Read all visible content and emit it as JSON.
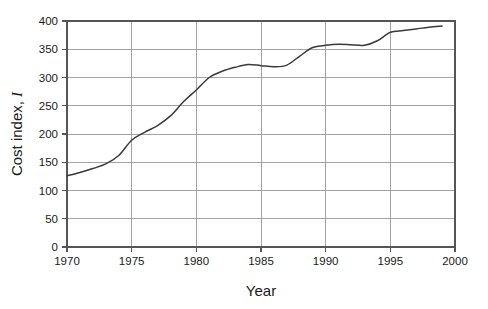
{
  "chart_data": {
    "type": "line",
    "title": "",
    "xlabel": "Year",
    "ylabel": "Cost index, I",
    "ylabel_text": "Cost index,",
    "ylabel_symbol": "I",
    "xlim": [
      1970,
      2000
    ],
    "ylim": [
      0,
      400
    ],
    "grid": true,
    "legend": "none",
    "x_ticks": [
      "1970",
      "1975",
      "1980",
      "1985",
      "1990",
      "1995",
      "2000"
    ],
    "x_tick_values": [
      1970,
      1975,
      1980,
      1985,
      1990,
      1995,
      2000
    ],
    "y_ticks": [
      "0",
      "50",
      "100",
      "150",
      "200",
      "250",
      "300",
      "350",
      "400"
    ],
    "y_tick_values": [
      0,
      50,
      100,
      150,
      200,
      250,
      300,
      350,
      400
    ],
    "series": [
      {
        "name": "Cost index",
        "color": "#3a3a3a",
        "x": [
          1970,
          1971,
          1972,
          1973,
          1974,
          1975,
          1976,
          1977,
          1978,
          1979,
          1980,
          1981,
          1982,
          1983,
          1984,
          1985,
          1986,
          1987,
          1988,
          1989,
          1990,
          1991,
          1992,
          1993,
          1994,
          1995,
          1996,
          1997,
          1998,
          1999
        ],
        "values": [
          126,
          132,
          139,
          147,
          162,
          189,
          203,
          215,
          232,
          257,
          278,
          300,
          311,
          318,
          323,
          321,
          319,
          322,
          338,
          353,
          357,
          359,
          358,
          357,
          365,
          380,
          383,
          386,
          389,
          391
        ]
      }
    ]
  },
  "plot_geometry": {
    "left": 67,
    "right": 455,
    "top": 21,
    "bottom": 247
  }
}
